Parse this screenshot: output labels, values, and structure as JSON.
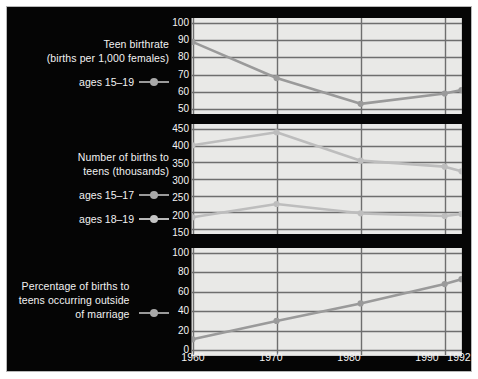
{
  "figure": {
    "background_color": "#050505",
    "panel_background_color": "#e9e9e7",
    "gridline_color": "#6e6e6e",
    "text_color": "#f2f2f2"
  },
  "legend": {
    "top": {
      "title": "Teen birthrate\n(births per 1,000 females)",
      "entries": [
        {
          "label": "ages 15–19",
          "marker": "line-dot-marker",
          "color": "#a8a8a8"
        }
      ]
    },
    "middle": {
      "title": "Number of births to\nteens (thousands)",
      "entries": [
        {
          "label": "ages 15–17",
          "marker": "line-dot-marker",
          "color": "#a8a8a8"
        },
        {
          "label": "ages 18–19",
          "marker": "line-dot-marker",
          "color": "#c4c4c4"
        }
      ]
    },
    "bottom": {
      "title": "Percentage of births to\nteens occurring outside\nof marriage",
      "entries": [
        {
          "label": "",
          "marker": "line-dot-marker",
          "color": "#a8a8a8"
        }
      ]
    }
  },
  "chart_data": [
    {
      "type": "line",
      "panel": "top",
      "title": "Teen birthrate (births per 1,000 females)",
      "xlabel": "",
      "ylabel": "births per 1,000 females",
      "x": [
        1960,
        1970,
        1980,
        1990,
        1992
      ],
      "xlim": [
        1960,
        1992
      ],
      "ylim": [
        50,
        100
      ],
      "yticks": [
        50,
        60,
        70,
        80,
        90,
        100
      ],
      "xticks": [
        1960,
        1970,
        1980,
        1990,
        1992
      ],
      "grid": true,
      "legend_position": "left",
      "series": [
        {
          "name": "ages 15–19",
          "values": [
            89,
            68,
            53,
            59,
            61
          ],
          "color": "#9a9a9a"
        }
      ]
    },
    {
      "type": "line",
      "panel": "middle",
      "title": "Number of births to teens (thousands)",
      "xlabel": "",
      "ylabel": "thousands of births",
      "x": [
        1960,
        1970,
        1980,
        1990,
        1992
      ],
      "xlim": [
        1960,
        1992
      ],
      "ylim": [
        150,
        450
      ],
      "yticks": [
        150,
        200,
        250,
        300,
        350,
        400,
        450
      ],
      "xticks": [
        1960,
        1970,
        1980,
        1990,
        1992
      ],
      "grid": true,
      "legend_position": "left",
      "series": [
        {
          "name": "ages 18–19",
          "values": [
            401,
            440,
            355,
            337,
            323
          ],
          "color": "#bdbdbd"
        },
        {
          "name": "ages 15–17",
          "values": [
            185,
            225,
            197,
            189,
            195
          ],
          "color": "#bdbdbd"
        }
      ]
    },
    {
      "type": "line",
      "panel": "bottom",
      "title": "Percentage of births to teens occurring outside of marriage",
      "xlabel": "",
      "ylabel": "percent",
      "x": [
        1960,
        1970,
        1980,
        1990,
        1992
      ],
      "xlim": [
        1960,
        1992
      ],
      "ylim": [
        0,
        100
      ],
      "yticks": [
        0,
        20,
        40,
        60,
        80,
        100
      ],
      "xticks": [
        1960,
        1970,
        1980,
        1990,
        1992
      ],
      "grid": true,
      "legend_position": "left",
      "series": [
        {
          "name": "percentage outside of marriage",
          "values": [
            11,
            30,
            48,
            68,
            73
          ],
          "color": "#9a9a9a"
        }
      ]
    }
  ],
  "axes": {
    "x_tick_labels": [
      "1960",
      "1970",
      "1980",
      "1990",
      "1992"
    ],
    "top_y_tick_labels": [
      "100",
      "90",
      "80",
      "70",
      "60",
      "50"
    ],
    "middle_y_tick_labels": [
      "450",
      "400",
      "350",
      "300",
      "250",
      "200",
      "150"
    ],
    "bottom_y_tick_labels": [
      "100",
      "80",
      "60",
      "40",
      "20",
      "0"
    ]
  }
}
